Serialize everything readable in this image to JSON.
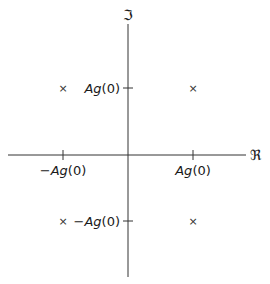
{
  "diagram": {
    "type": "complex-plane",
    "axes": {
      "real": {
        "label": "ℜ"
      },
      "imaginary": {
        "label": "ℑ"
      }
    },
    "ticks": {
      "imag_pos": {
        "prefix": "",
        "A": "A",
        "g": "g",
        "arg": "(0)"
      },
      "imag_neg": {
        "prefix": "−",
        "A": "A",
        "g": "g",
        "arg": "(0)"
      },
      "real_pos": {
        "prefix": "",
        "A": "A",
        "g": "g",
        "arg": "(0)"
      },
      "real_neg": {
        "prefix": "−",
        "A": "A",
        "g": "g",
        "arg": "(0)"
      }
    },
    "points": [
      {
        "symbol": "×",
        "re": "-Ag(0)",
        "im": "Ag(0)"
      },
      {
        "symbol": "×",
        "re": "Ag(0)",
        "im": "Ag(0)"
      },
      {
        "symbol": "×",
        "re": "-Ag(0)",
        "im": "-Ag(0)"
      },
      {
        "symbol": "×",
        "re": "Ag(0)",
        "im": "-Ag(0)"
      }
    ],
    "colors": {
      "ink": "#1a1a1a",
      "background": "#ffffff"
    }
  }
}
